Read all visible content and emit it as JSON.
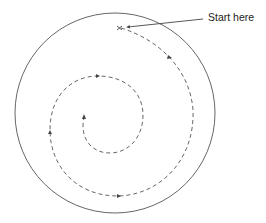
{
  "diagram": {
    "type": "spiral-path-in-circle",
    "label": "Start here",
    "colors": {
      "stroke": "#555555",
      "text": "#222222",
      "background": "#ffffff"
    },
    "outer_circle": {
      "cx": 115,
      "cy": 113,
      "r": 100
    },
    "spiral": {
      "direction": "clockwise-inward",
      "style": "dashed",
      "start_point": [
        120,
        28
      ],
      "end_point": [
        84,
        116
      ],
      "arrowheads": 6
    }
  }
}
